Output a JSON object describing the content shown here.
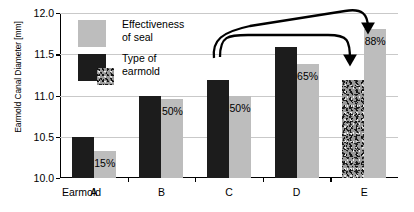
{
  "chart_data": {
    "type": "bar",
    "title": "",
    "subtitle": "",
    "xlabel": "Earmold",
    "ylabel": "Earmold Canal Diameter [mm]",
    "categories": [
      "A",
      "B",
      "C",
      "D",
      "E"
    ],
    "ylim": [
      10.0,
      12.0
    ],
    "ytick_labels": [
      "10.0",
      "10.5",
      "11.0",
      "11.5",
      "12.0"
    ],
    "ytick_values": [
      10.0,
      10.5,
      11.0,
      11.5,
      12.0
    ],
    "grid": true,
    "legend_position": "inside-upper-left",
    "series": [
      {
        "name": "Type of earmold",
        "color": "#1c1c1c",
        "values": [
          10.5,
          10.99,
          11.19,
          11.59,
          11.19
        ],
        "point_styles": [
          "solid",
          "solid",
          "solid",
          "solid",
          "speckled"
        ]
      },
      {
        "name": "Effectiveness of seal",
        "color": "#bdbdbd",
        "values": [
          10.33,
          10.96,
          10.99,
          11.38,
          11.81
        ],
        "data_labels": [
          "15%",
          "50%",
          "50%",
          "65%",
          "88%"
        ]
      }
    ],
    "annotations": [
      {
        "name": "arrow-c-dark-to-e-speckle",
        "label": "",
        "from": "C type-of-earmold bar",
        "to": "E type-of-earmold bar"
      },
      {
        "name": "arrow-c-dark-to-e-seal",
        "label": "",
        "from": "C type-of-earmold bar",
        "to": "E effectiveness-of-seal bar"
      }
    ]
  },
  "legend": {
    "items": [
      {
        "label": "Effectiveness\nof seal",
        "swatch": "light-gray-square"
      },
      {
        "label": "Type of\nearmold",
        "swatch": "dark-square-with-speckled-square"
      }
    ]
  },
  "axis": {
    "y_title": "Earmold Canal Diameter [mm]",
    "x_title": "Earmold"
  }
}
